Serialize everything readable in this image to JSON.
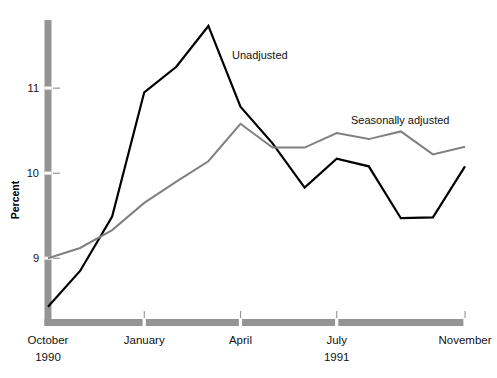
{
  "chart_data": {
    "type": "line",
    "title": "",
    "xlabel": "",
    "ylabel": "Percent",
    "ylim": [
      8.25,
      11.8
    ],
    "yticks": [
      9,
      10,
      11
    ],
    "ytick_labels": [
      "9",
      "10",
      "11"
    ],
    "grid": false,
    "legend_position": "inline-annotations",
    "x": [
      "October 1990",
      "November 1990",
      "December 1990",
      "January 1991",
      "February 1991",
      "March 1991",
      "April 1991",
      "May 1991",
      "June 1991",
      "July 1991",
      "August 1991",
      "September 1991",
      "October 1991",
      "November 1991"
    ],
    "xtick_labels": [
      "October",
      "January",
      "April",
      "July",
      "November"
    ],
    "xtick_years": [
      "1990",
      "1991"
    ],
    "series": [
      {
        "name": "Unadjusted",
        "color": "#000000",
        "values": [
          8.43,
          8.85,
          9.49,
          10.95,
          11.25,
          11.73,
          10.78,
          10.35,
          9.83,
          10.17,
          10.08,
          9.47,
          9.48,
          10.08
        ]
      },
      {
        "name": "Seasonally adjusted",
        "color": "#808080",
        "values": [
          9.0,
          9.12,
          9.33,
          9.65,
          9.9,
          10.14,
          10.58,
          10.3,
          10.3,
          10.47,
          10.4,
          10.49,
          10.22,
          10.31
        ]
      }
    ],
    "annotations": [
      {
        "text": "Unadjusted",
        "x_px": 232,
        "y_px": 59
      },
      {
        "text": "Seasonally adjusted",
        "x_px": 351,
        "y_px": 124
      }
    ],
    "axis_style": {
      "axis_color": "#949494",
      "axis_thickness": 7,
      "tick_color": "#949494"
    }
  }
}
